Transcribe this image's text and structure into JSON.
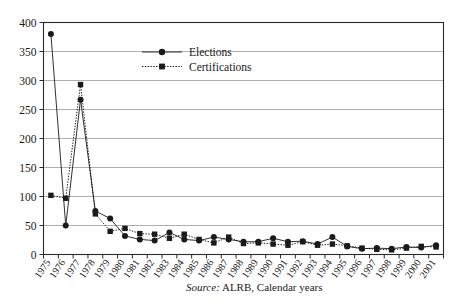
{
  "chart_data": {
    "type": "line",
    "title": "",
    "xlabel": "",
    "ylabel": "",
    "ylim": [
      0,
      400
    ],
    "ytick_step": 50,
    "yticks": [
      0,
      50,
      100,
      150,
      200,
      250,
      300,
      350,
      400
    ],
    "grid": true,
    "legend_position": "top-center",
    "categories": [
      "1975",
      "1976",
      "1977",
      "1978",
      "1979",
      "1980",
      "1981",
      "1982",
      "1983",
      "1984",
      "1985",
      "1986",
      "1987",
      "1988",
      "1989",
      "1990",
      "1991",
      "1992",
      "1993",
      "1994",
      "1995",
      "1996",
      "1997",
      "1998",
      "1999",
      "2000",
      "2001"
    ],
    "series": [
      {
        "name": "Elections",
        "marker": "circle",
        "line_style": "solid",
        "color": "#1a1a1a",
        "values": [
          380,
          50,
          267,
          75,
          62,
          32,
          26,
          24,
          38,
          26,
          24,
          30,
          26,
          22,
          22,
          28,
          22,
          23,
          18,
          30,
          14,
          10,
          11,
          10,
          13,
          12,
          16
        ]
      },
      {
        "name": "Certifications",
        "marker": "square",
        "line_style": "dotted",
        "color": "#1a1a1a",
        "values": [
          102,
          97,
          293,
          70,
          40,
          45,
          36,
          35,
          28,
          35,
          26,
          20,
          30,
          19,
          20,
          18,
          16,
          22,
          16,
          18,
          15,
          11,
          9,
          8,
          11,
          14,
          13
        ]
      }
    ]
  },
  "legend": {
    "items": [
      {
        "label": "Elections"
      },
      {
        "label": "Certifications"
      }
    ]
  },
  "source": {
    "lead": "Source:",
    "text": " ALRB, Calendar years"
  }
}
